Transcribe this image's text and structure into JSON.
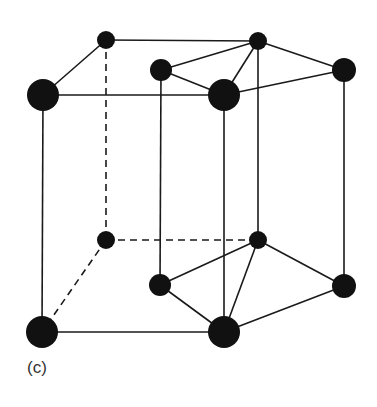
{
  "figure": {
    "label": "(c)",
    "colors": {
      "atom": "#111111",
      "edge": "#1a1a1a",
      "label": "#333333",
      "background": "#ffffff"
    },
    "atoms": [
      {
        "id": "top-back-left",
        "x": 106,
        "y": 40,
        "r": 9
      },
      {
        "id": "top-back-right",
        "x": 258,
        "y": 41,
        "r": 9
      },
      {
        "id": "top-mid-left",
        "x": 161,
        "y": 70,
        "r": 11
      },
      {
        "id": "top-right",
        "x": 344,
        "y": 70,
        "r": 12
      },
      {
        "id": "top-front-left",
        "x": 43,
        "y": 95,
        "r": 16
      },
      {
        "id": "top-front-center",
        "x": 224,
        "y": 95,
        "r": 16
      },
      {
        "id": "bottom-back-left",
        "x": 106,
        "y": 240,
        "r": 9
      },
      {
        "id": "bottom-back-right",
        "x": 258,
        "y": 240,
        "r": 9
      },
      {
        "id": "bottom-mid-left",
        "x": 160,
        "y": 285,
        "r": 11
      },
      {
        "id": "bottom-right",
        "x": 344,
        "y": 286,
        "r": 12
      },
      {
        "id": "bottom-front-left",
        "x": 42,
        "y": 332,
        "r": 16
      },
      {
        "id": "bottom-front-center",
        "x": 224,
        "y": 332,
        "r": 16
      }
    ],
    "edges": [
      {
        "from": "top-back-left",
        "to": "top-back-right",
        "style": "solid"
      },
      {
        "from": "top-back-left",
        "to": "top-front-left",
        "style": "solid"
      },
      {
        "from": "top-front-left",
        "to": "top-front-center",
        "style": "solid"
      },
      {
        "from": "top-mid-left",
        "to": "top-back-right",
        "style": "solid"
      },
      {
        "from": "top-mid-left",
        "to": "top-front-center",
        "style": "solid"
      },
      {
        "from": "top-front-center",
        "to": "top-back-right",
        "style": "solid"
      },
      {
        "from": "top-back-right",
        "to": "top-right",
        "style": "solid"
      },
      {
        "from": "top-front-center",
        "to": "top-right",
        "style": "solid"
      },
      {
        "from": "top-front-left",
        "to": "bottom-front-left",
        "style": "solid"
      },
      {
        "from": "top-front-center",
        "to": "bottom-front-center",
        "style": "solid"
      },
      {
        "from": "top-mid-left",
        "to": "bottom-mid-left",
        "style": "solid"
      },
      {
        "from": "top-back-right",
        "to": "bottom-back-right",
        "style": "solid"
      },
      {
        "from": "top-right",
        "to": "bottom-right",
        "style": "solid"
      },
      {
        "from": "top-back-left",
        "to": "bottom-back-left",
        "style": "dashed"
      },
      {
        "from": "bottom-back-left",
        "to": "bottom-back-right",
        "style": "dashed"
      },
      {
        "from": "bottom-back-left",
        "to": "bottom-front-left",
        "style": "dashed"
      },
      {
        "from": "bottom-front-left",
        "to": "bottom-front-center",
        "style": "solid"
      },
      {
        "from": "bottom-mid-left",
        "to": "bottom-back-right",
        "style": "solid"
      },
      {
        "from": "bottom-mid-left",
        "to": "bottom-front-center",
        "style": "solid"
      },
      {
        "from": "bottom-front-center",
        "to": "bottom-back-right",
        "style": "solid"
      },
      {
        "from": "bottom-back-right",
        "to": "bottom-right",
        "style": "solid"
      },
      {
        "from": "bottom-front-center",
        "to": "bottom-right",
        "style": "solid"
      }
    ]
  }
}
